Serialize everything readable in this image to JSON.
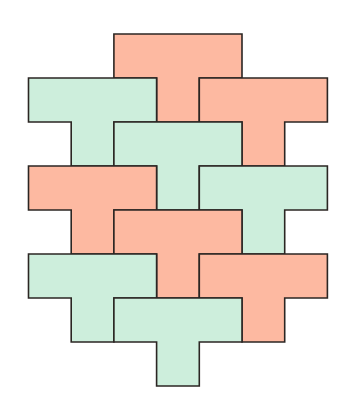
{
  "diagram": {
    "title": "",
    "type": "T-tetromino tessellation",
    "grid": {
      "origin_x": 28.5,
      "origin_y": 34,
      "unit_x": 42.7,
      "unit_y": 44
    },
    "colors": {
      "salmon": "#fdb9a1",
      "green": "#cdeedc",
      "outline": "#2b2623",
      "background": "#ffffff"
    },
    "pieces": [
      {
        "id": "t-salmon-1",
        "color": "salmon",
        "col": 2,
        "row": 0
      },
      {
        "id": "t-green-1",
        "color": "green",
        "col": 0,
        "row": 1
      },
      {
        "id": "t-salmon-2",
        "color": "salmon",
        "col": 4,
        "row": 1
      },
      {
        "id": "t-green-2",
        "color": "green",
        "col": 2,
        "row": 2
      },
      {
        "id": "t-salmon-3",
        "color": "salmon",
        "col": 0,
        "row": 3
      },
      {
        "id": "t-green-3",
        "color": "green",
        "col": 4,
        "row": 3
      },
      {
        "id": "t-salmon-4",
        "color": "salmon",
        "col": 2,
        "row": 4
      },
      {
        "id": "t-green-4",
        "color": "green",
        "col": 0,
        "row": 5
      },
      {
        "id": "t-salmon-5",
        "color": "salmon",
        "col": 4,
        "row": 5
      },
      {
        "id": "t-green-5",
        "color": "green",
        "col": 2,
        "row": 6
      }
    ]
  }
}
